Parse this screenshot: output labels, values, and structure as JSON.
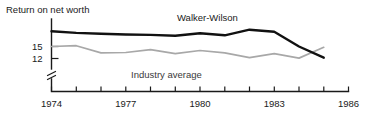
{
  "chart_data": {
    "type": "line",
    "title": "Return on net worth",
    "xlabel": "",
    "ylabel": "Return on net worth",
    "xlim": [
      1974,
      1986
    ],
    "ylim": [
      10.5,
      19.5
    ],
    "grid": false,
    "y_axis_break": true,
    "legend_position": "inline-annotations",
    "x_tick_labels": [
      "1974",
      "1977",
      "1980",
      "1983",
      "1986"
    ],
    "x_tick_values": [
      1974,
      1977,
      1980,
      1983,
      1986
    ],
    "x_minor_ticks": [
      1975,
      1976,
      1978,
      1979,
      1981,
      1982,
      1984,
      1985
    ],
    "y_tick_labels": [
      "15",
      "12"
    ],
    "y_tick_values": [
      15,
      12
    ],
    "x": [
      1974,
      1975,
      1976,
      1977,
      1978,
      1979,
      1980,
      1981,
      1982,
      1983,
      1984,
      1985
    ],
    "series": [
      {
        "name": "Walker-Wilson",
        "color": "#111111",
        "label_x": 1982.0,
        "label_y": 19.0,
        "values": [
          18.8,
          18.4,
          18.2,
          18.0,
          17.9,
          17.7,
          18.3,
          17.8,
          19.2,
          18.7,
          15.0,
          12.2
        ]
      },
      {
        "name": "Industry average",
        "color": "#a8a8a8",
        "label_x": 1979.4,
        "label_y": 11.2,
        "values": [
          15.0,
          15.2,
          13.4,
          13.5,
          14.2,
          13.2,
          14.0,
          13.4,
          12.2,
          13.2,
          12.1,
          14.8
        ]
      }
    ],
    "annotations": [
      {
        "text": "Return on net worth",
        "x_px": 6,
        "y_px": 12
      },
      {
        "text": "Walker-Wilson",
        "x_px": 177,
        "y_px": 20
      },
      {
        "text": "Industry average",
        "x_px": 131,
        "y_px": 75
      }
    ]
  },
  "axis_title": "Return on net worth",
  "series_labels": {
    "primary": "Walker-Wilson",
    "secondary": "Industry average"
  },
  "y_ticks": {
    "upper": "15",
    "lower": "12"
  },
  "x_ticks": {
    "t0": "1974",
    "t1": "1977",
    "t2": "1980",
    "t3": "1983",
    "t4": "1986"
  }
}
